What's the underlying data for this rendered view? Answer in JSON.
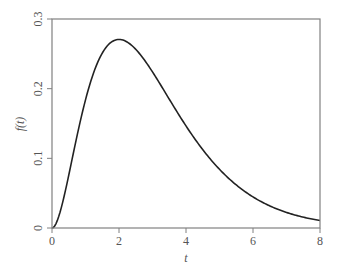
{
  "chart_data": {
    "type": "line",
    "title": "",
    "xlabel": "t",
    "ylabel": "f(t)",
    "xlim": [
      0,
      8
    ],
    "ylim": [
      0,
      0.3
    ],
    "grid": false,
    "legend": null,
    "x_ticks": [
      0,
      2,
      4,
      6,
      8
    ],
    "x_tick_labels": [
      "0",
      "2",
      "4",
      "6",
      "8"
    ],
    "y_ticks": [
      0,
      0.1,
      0.2,
      0.3
    ],
    "y_tick_labels": [
      "0",
      "0.1",
      "0.2",
      "0.3"
    ],
    "series": [
      {
        "name": "f(t)",
        "color": "#222222",
        "x": [
          0,
          0.25,
          0.5,
          0.75,
          1,
          1.25,
          1.5,
          1.75,
          2,
          2.25,
          2.5,
          2.75,
          3,
          3.5,
          4,
          4.5,
          5,
          5.5,
          6,
          6.5,
          7,
          7.5,
          8
        ],
        "values": [
          0,
          0.0024,
          0.0758,
          0.1329,
          0.1839,
          0.2238,
          0.251,
          0.266,
          0.2707,
          0.2668,
          0.2565,
          0.2414,
          0.224,
          0.185,
          0.1465,
          0.1125,
          0.0842,
          0.0618,
          0.0446,
          0.0318,
          0.0223,
          0.0156,
          0.0107
        ]
      }
    ]
  },
  "frame": {
    "color": "#808080"
  }
}
